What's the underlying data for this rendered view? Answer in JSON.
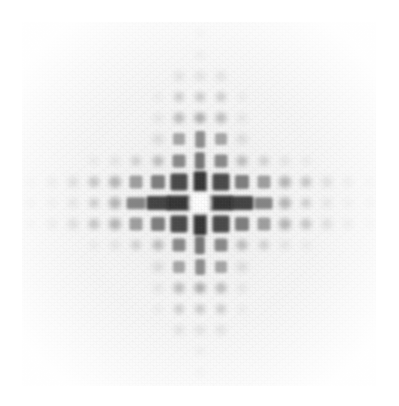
{
  "image": {
    "title": "Simulated electron diffraction pattern",
    "kind": "diffraction-pattern",
    "width": 399,
    "height": 406,
    "background_color": "#ffffff",
    "plate_color": "#f7f7f7",
    "spot_color": "#2b2b2b",
    "plate": {
      "x": 22,
      "y": 22,
      "width": 354,
      "height": 364
    },
    "center": {
      "x": 200,
      "y": 203
    },
    "lattice_spacing_px": 21.2,
    "symmetry": "4-fold (square lattice, cross/plus envelope)",
    "notes": "Bright undiffracted central disc surrounded by four strong first-order reflections; intensity decays radially; reflections confined to the horizontal and vertical axial arms."
  },
  "chart_data": {
    "type": "heatmap",
    "title": "Simulated electron diffraction pattern",
    "xlabel": "",
    "ylabel": "",
    "grid": false,
    "legend": "none",
    "center_px": [
      200,
      203
    ],
    "spacing_px": 21.2,
    "xlim": [
      -8,
      8
    ],
    "ylim": [
      -8,
      8
    ],
    "colormap": "gray_r",
    "value_range": [
      0,
      1
    ],
    "comment": "points are [h, k, intensity, size_px] on a square reciprocal lattice; h = horizontal index, k = vertical index (positive = down)",
    "points": [
      [
        0,
        0,
        0.1,
        13
      ],
      [
        -1,
        0,
        0.95,
        18
      ],
      [
        1,
        0,
        0.95,
        18
      ],
      [
        0,
        -1,
        0.95,
        16
      ],
      [
        0,
        1,
        0.95,
        16
      ],
      [
        -2,
        0,
        0.88,
        17
      ],
      [
        2,
        0,
        0.88,
        17
      ],
      [
        0,
        -2,
        0.62,
        13
      ],
      [
        0,
        2,
        0.62,
        13
      ],
      [
        -3,
        0,
        0.55,
        14
      ],
      [
        3,
        0,
        0.55,
        14
      ],
      [
        0,
        -3,
        0.5,
        12
      ],
      [
        0,
        3,
        0.5,
        12
      ],
      [
        -4,
        0,
        0.3,
        12
      ],
      [
        4,
        0,
        0.3,
        12
      ],
      [
        0,
        -4,
        0.34,
        11
      ],
      [
        0,
        4,
        0.34,
        11
      ],
      [
        -5,
        0,
        0.18,
        10
      ],
      [
        5,
        0,
        0.18,
        10
      ],
      [
        0,
        -5,
        0.2,
        10
      ],
      [
        0,
        5,
        0.2,
        10
      ],
      [
        -6,
        0,
        0.1,
        9
      ],
      [
        6,
        0,
        0.1,
        9
      ],
      [
        0,
        -6,
        0.12,
        9
      ],
      [
        0,
        6,
        0.12,
        9
      ],
      [
        -7,
        0,
        0.06,
        8
      ],
      [
        7,
        0,
        0.06,
        8
      ],
      [
        0,
        -7,
        0.07,
        8
      ],
      [
        0,
        7,
        0.07,
        8
      ],
      [
        -1,
        -1,
        0.85,
        17
      ],
      [
        1,
        -1,
        0.85,
        17
      ],
      [
        -1,
        1,
        0.85,
        17
      ],
      [
        1,
        1,
        0.85,
        17
      ],
      [
        -2,
        -1,
        0.58,
        14
      ],
      [
        2,
        -1,
        0.58,
        14
      ],
      [
        -2,
        1,
        0.58,
        14
      ],
      [
        2,
        1,
        0.58,
        14
      ],
      [
        -1,
        -2,
        0.52,
        13
      ],
      [
        1,
        -2,
        0.52,
        13
      ],
      [
        -1,
        2,
        0.52,
        13
      ],
      [
        1,
        2,
        0.52,
        13
      ],
      [
        -3,
        -1,
        0.42,
        13
      ],
      [
        3,
        -1,
        0.42,
        13
      ],
      [
        -3,
        1,
        0.42,
        13
      ],
      [
        3,
        1,
        0.42,
        13
      ],
      [
        -1,
        -3,
        0.38,
        12
      ],
      [
        1,
        -3,
        0.38,
        12
      ],
      [
        -1,
        3,
        0.38,
        12
      ],
      [
        1,
        3,
        0.38,
        12
      ],
      [
        -2,
        -2,
        0.26,
        11
      ],
      [
        2,
        -2,
        0.26,
        11
      ],
      [
        -2,
        2,
        0.26,
        11
      ],
      [
        2,
        2,
        0.26,
        11
      ],
      [
        -4,
        -1,
        0.3,
        12
      ],
      [
        4,
        -1,
        0.3,
        12
      ],
      [
        -4,
        1,
        0.3,
        12
      ],
      [
        4,
        1,
        0.3,
        12
      ],
      [
        -1,
        -4,
        0.26,
        11
      ],
      [
        1,
        -4,
        0.26,
        11
      ],
      [
        -1,
        4,
        0.26,
        11
      ],
      [
        1,
        4,
        0.26,
        11
      ],
      [
        -5,
        -1,
        0.22,
        11
      ],
      [
        5,
        -1,
        0.22,
        11
      ],
      [
        -5,
        1,
        0.22,
        11
      ],
      [
        5,
        1,
        0.22,
        11
      ],
      [
        -1,
        -5,
        0.18,
        10
      ],
      [
        1,
        -5,
        0.18,
        10
      ],
      [
        -1,
        5,
        0.18,
        10
      ],
      [
        1,
        5,
        0.18,
        10
      ],
      [
        -6,
        -1,
        0.14,
        10
      ],
      [
        6,
        -1,
        0.14,
        10
      ],
      [
        -6,
        1,
        0.14,
        10
      ],
      [
        6,
        1,
        0.14,
        10
      ],
      [
        -1,
        -6,
        0.12,
        9
      ],
      [
        1,
        -6,
        0.12,
        9
      ],
      [
        -1,
        6,
        0.12,
        9
      ],
      [
        1,
        6,
        0.12,
        9
      ],
      [
        -7,
        -1,
        0.08,
        9
      ],
      [
        7,
        -1,
        0.08,
        9
      ],
      [
        -7,
        1,
        0.08,
        9
      ],
      [
        7,
        1,
        0.08,
        9
      ],
      [
        -3,
        -2,
        0.16,
        10
      ],
      [
        3,
        -2,
        0.16,
        10
      ],
      [
        -3,
        2,
        0.16,
        10
      ],
      [
        3,
        2,
        0.16,
        10
      ],
      [
        -2,
        -3,
        0.14,
        10
      ],
      [
        2,
        -3,
        0.14,
        10
      ],
      [
        -2,
        3,
        0.14,
        10
      ],
      [
        2,
        3,
        0.14,
        10
      ],
      [
        -4,
        -2,
        0.1,
        9
      ],
      [
        4,
        -2,
        0.1,
        9
      ],
      [
        -4,
        2,
        0.1,
        9
      ],
      [
        4,
        2,
        0.1,
        9
      ],
      [
        -2,
        -4,
        0.09,
        9
      ],
      [
        2,
        -4,
        0.09,
        9
      ],
      [
        -2,
        4,
        0.09,
        9
      ],
      [
        2,
        4,
        0.09,
        9
      ],
      [
        -5,
        -2,
        0.07,
        8
      ],
      [
        5,
        -2,
        0.07,
        8
      ],
      [
        -5,
        2,
        0.07,
        8
      ],
      [
        5,
        2,
        0.07,
        8
      ],
      [
        -2,
        -5,
        0.06,
        8
      ],
      [
        2,
        -5,
        0.06,
        8
      ],
      [
        -2,
        5,
        0.06,
        8
      ],
      [
        2,
        5,
        0.06,
        8
      ],
      [
        -8,
        0,
        0.05,
        8
      ],
      [
        8,
        0,
        0.05,
        8
      ],
      [
        0,
        -8,
        0.05,
        8
      ],
      [
        0,
        8,
        0.05,
        8
      ],
      [
        -8,
        -1,
        0.04,
        8
      ],
      [
        8,
        -1,
        0.04,
        8
      ],
      [
        -8,
        1,
        0.04,
        8
      ],
      [
        8,
        1,
        0.04,
        8
      ]
    ]
  }
}
